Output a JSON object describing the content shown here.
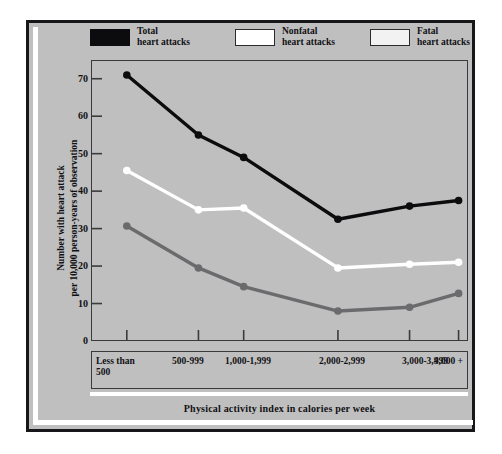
{
  "chart_data": {
    "type": "line",
    "title": "",
    "xlabel": "Physical activity index in calories per week",
    "ylabel": "Number with heart attack\nper 10,000 person-years of observation",
    "ylabel_line1": "Number with heart attack",
    "ylabel_line2": "per 10,000 person-years of observation",
    "categories": [
      "Less than\n500",
      "500-999",
      "1,000-1,999",
      "2,000-2,999",
      "3,000-3,999",
      "4,000 +"
    ],
    "ylim": [
      0,
      75
    ],
    "yticks": [
      0,
      10,
      20,
      30,
      40,
      50,
      60,
      70
    ],
    "grid": false,
    "legend_position": "above-plot",
    "series": [
      {
        "name": "Total heart attacks",
        "legend_label_line1": "Total",
        "legend_label_line2": "heart attacks",
        "color": "#0c0c0e",
        "values": [
          71,
          55,
          49,
          32.5,
          36,
          37.5
        ]
      },
      {
        "name": "Nonfatal heart attacks",
        "legend_label_line1": "Nonfatal",
        "legend_label_line2": "heart attacks",
        "color": "#ffffff",
        "values": [
          45.5,
          35,
          35.5,
          19.5,
          20.5,
          21
        ]
      },
      {
        "name": "Fatal heart attacks",
        "legend_label_line1": "Fatal",
        "legend_label_line2": "heart attacks",
        "color": "#6b6b6e",
        "values": [
          30.7,
          19.5,
          14.5,
          8,
          9,
          12.7
        ]
      }
    ]
  },
  "figure": {
    "background_color": "#bfbfbf",
    "frame_color": "#17171a",
    "accent_color": "#ffffff"
  },
  "axis": {
    "ytick_labels": [
      "70",
      "60",
      "50",
      "40",
      "30",
      "20",
      "10",
      "0"
    ]
  }
}
